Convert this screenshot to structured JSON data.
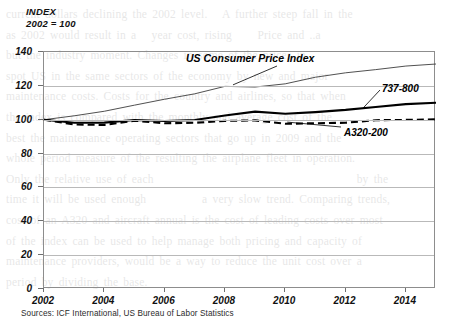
{
  "axis_heading": {
    "line1": "INDEX",
    "line2": "2002 = 100"
  },
  "labels": {
    "cpi": "US Consumer Price Index",
    "b737": "737-800",
    "a320": "A320-200"
  },
  "source_note": "Sources: ICF International, US Bureau of Labor Statistics",
  "background_text": "current dollars declining the 2002 level.   A further steep fall in the\nas 2002 would result in a   year cost, rising     Price and ..a\nbut the industry moment. Changes in some of the prices in .\nspot US in the same sectors of the economy by new and major\nmaintenance costs. Costs for the country and airlines, so that when\nthe index is compared with the monthly and average cost of the\nbest the maintenance operating sectors that go up in 2009 and the\nwhole period measure of the resulting the airplane fleet in operation.\nOnly the relative use of each                                        by the\ntime it will be used enough           a very slow trend. Comparing trends,\ncost of an A320 and aircraft annual is the cost of leading costs over most\nof the index can be used to help manage both pricing and capacity of\nmaintenance providers, would be a way to reduce the unit cost over a\nperiod by dividing the base.",
  "chart_data": {
    "type": "line",
    "title": "INDEX 2002 = 100",
    "xlabel": "",
    "ylabel": "INDEX, 2002 = 100",
    "xlim": [
      2002,
      2015
    ],
    "ylim": [
      0,
      140
    ],
    "yticks": [
      0,
      20,
      40,
      60,
      80,
      100,
      120,
      140
    ],
    "xticks": [
      2002,
      2004,
      2006,
      2008,
      2010,
      2012,
      2014
    ],
    "grid": "horizontal",
    "legend": "inline-annotations",
    "x": [
      2002,
      2003,
      2004,
      2005,
      2006,
      2007,
      2008,
      2009,
      2010,
      2011,
      2012,
      2013,
      2014,
      2015
    ],
    "series": [
      {
        "name": "US Consumer Price Index",
        "style": "thin-solid",
        "color": "#3c3c3c",
        "values": [
          100,
          102.3,
          105.0,
          108.6,
          112.1,
          115.3,
          119.7,
          119.3,
          121.2,
          125.1,
          127.7,
          129.6,
          131.7,
          132.9
        ]
      },
      {
        "name": "737-800",
        "style": "thick-solid",
        "color": "#000000",
        "values": [
          100,
          98.2,
          98.3,
          99.8,
          99.2,
          99.8,
          102.5,
          104.8,
          103.5,
          104.5,
          105.8,
          107.5,
          109.2,
          110.0
        ]
      },
      {
        "name": "A320-200",
        "style": "dashed",
        "color": "#000000",
        "values": [
          100,
          97.2,
          96.9,
          99.4,
          97.9,
          98.2,
          99.3,
          99.6,
          97.6,
          97.9,
          98.2,
          99.7,
          99.9,
          100.2
        ]
      }
    ],
    "annotations": [
      {
        "text": "US Consumer Price Index",
        "points_to_year": 2008.3,
        "points_to_value": 120
      },
      {
        "text": "737-800",
        "points_to_year": 2012.6,
        "points_to_value": 106
      },
      {
        "text": "A320-200",
        "points_to_year": 2010.1,
        "points_to_value": 98
      }
    ],
    "source": "Sources: ICF International, US Bureau of Labor Statistics"
  }
}
